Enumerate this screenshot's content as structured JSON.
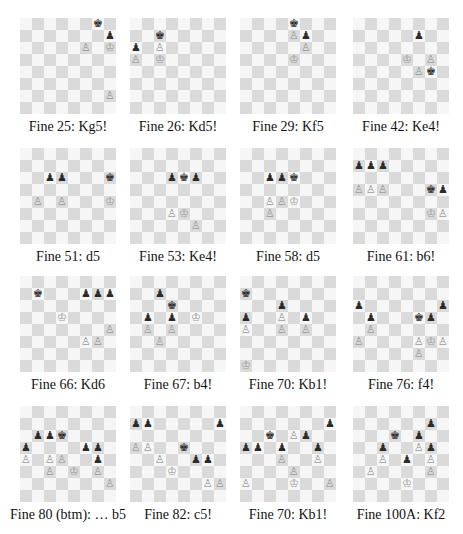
{
  "page": {
    "board_colors": {
      "light": "#f6f6f6",
      "dark": "#dadada"
    },
    "piece_glyphs": {
      "K": "♔",
      "P": "♙",
      "k": "♚",
      "p": "♟"
    }
  },
  "diagrams": [
    {
      "caption": "Fine 25: Kg5!",
      "x": 20,
      "y": 18,
      "pieces": {
        "g8": "k",
        "h7": "p",
        "f6": "P",
        "h6": "K",
        "h2": "P"
      }
    },
    {
      "caption": "Fine 26: Kd5!",
      "x": 130,
      "y": 18,
      "pieces": {
        "c7": "k",
        "a6": "p",
        "c6": "P",
        "a5": "P",
        "c5": "K"
      }
    },
    {
      "caption": "Fine 29: Kf5",
      "x": 240,
      "y": 18,
      "pieces": {
        "e8": "k",
        "e7": "P",
        "f7": "p",
        "f6": "P",
        "e5": "K"
      }
    },
    {
      "caption": "Fine 42: Ke4!",
      "x": 353,
      "y": 18,
      "pieces": {
        "f7": "p",
        "e5": "K",
        "g5": "P",
        "f4": "P",
        "g4": "k"
      }
    },
    {
      "caption": "Fine 51: d5",
      "x": 20,
      "y": 148,
      "pieces": {
        "c6": "p",
        "d6": "p",
        "h6": "k",
        "b4": "P",
        "d4": "P",
        "h4": "K"
      }
    },
    {
      "caption": "Fine 53: Ke4!",
      "x": 130,
      "y": 148,
      "pieces": {
        "d6": "p",
        "e6": "k",
        "f6": "p",
        "d3": "P",
        "e3": "K",
        "f2": "P"
      }
    },
    {
      "caption": "Fine 58: d5",
      "x": 240,
      "y": 148,
      "pieces": {
        "c6": "p",
        "d6": "p",
        "e6": "k",
        "c4": "P",
        "d4": "P",
        "e4": "K",
        "c3": "P"
      }
    },
    {
      "caption": "Fine 61: b6!",
      "x": 353,
      "y": 148,
      "pieces": {
        "a7": "p",
        "b7": "p",
        "c7": "p",
        "a5": "P",
        "b5": "P",
        "c5": "P",
        "g5": "k",
        "h5": "p",
        "g3": "K",
        "h3": "P"
      }
    },
    {
      "caption": "Fine 66: Kd6",
      "x": 20,
      "y": 276,
      "pieces": {
        "b7": "k",
        "f7": "p",
        "g7": "p",
        "h7": "p",
        "d5": "K",
        "h4": "P",
        "f3": "P",
        "g3": "P"
      }
    },
    {
      "caption": "Fine 67: b4!",
      "x": 130,
      "y": 276,
      "pieces": {
        "c7": "p",
        "d6": "k",
        "b5": "p",
        "d5": "p",
        "f5": "K",
        "b4": "P",
        "d4": "P",
        "c3": "P"
      }
    },
    {
      "caption": "Fine 70: Kb1!",
      "x": 240,
      "y": 276,
      "pieces": {
        "a7": "k",
        "d6": "p",
        "a5": "p",
        "d5": "P",
        "f5": "p",
        "a4": "P",
        "d4": "P",
        "f4": "P",
        "a1": "K"
      }
    },
    {
      "caption": "Fine 76: f4!",
      "x": 353,
      "y": 276,
      "pieces": {
        "a6": "p",
        "h6": "p",
        "b5": "p",
        "f5": "k",
        "g5": "p",
        "b4": "P",
        "a3": "P",
        "f3": "P",
        "g3": "K",
        "h3": "P",
        "f2": "P"
      }
    },
    {
      "caption": "Fine 80 (btm): … b5",
      "x": 20,
      "y": 406,
      "pieces": {
        "b6": "p",
        "c6": "p",
        "d6": "k",
        "a5": "p",
        "f5": "p",
        "g5": "p",
        "a4": "P",
        "c4": "P",
        "d4": "P",
        "g4": "p",
        "c3": "P",
        "e3": "K",
        "g3": "P",
        "h2": "P"
      }
    },
    {
      "caption": "Fine 82: c5!",
      "x": 130,
      "y": 406,
      "pieces": {
        "a7": "p",
        "b7": "p",
        "h7": "p",
        "a5": "P",
        "b5": "P",
        "e5": "k",
        "c4": "P",
        "f4": "p",
        "g4": "p",
        "d3": "K",
        "g2": "P",
        "h2": "P"
      }
    },
    {
      "caption": "Fine 70: Kb1!",
      "x": 240,
      "y": 406,
      "pieces": {
        "h7": "p",
        "c6": "k",
        "e6": "P",
        "f6": "p",
        "a5": "p",
        "b5": "p",
        "d5": "p",
        "g5": "p",
        "d4": "P",
        "g4": "P",
        "e3": "P",
        "a2": "P",
        "e2": "K",
        "h2": "P"
      }
    },
    {
      "caption": "Fine 100A: Kf2",
      "x": 353,
      "y": 406,
      "pieces": {
        "g7": "p",
        "d6": "k",
        "f6": "p",
        "c5": "p",
        "f5": "P",
        "g5": "p",
        "c4": "P",
        "e4": "p",
        "g4": "P",
        "b3": "P",
        "g3": "P",
        "e2": "K"
      }
    }
  ]
}
